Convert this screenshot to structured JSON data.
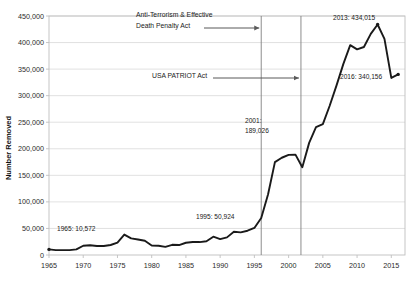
{
  "chart_data": {
    "type": "line",
    "title": "",
    "xlabel": "",
    "ylabel": "Number Removed",
    "xlim": [
      1965,
      2017
    ],
    "ylim": [
      0,
      450000
    ],
    "grid": true,
    "legend": "none",
    "x_ticks": [
      "1965",
      "1970",
      "1975",
      "1980",
      "1985",
      "1990",
      "1995",
      "2000",
      "2005",
      "2010",
      "2015"
    ],
    "y_ticks": [
      "0",
      "50,000",
      "100,000",
      "150,000",
      "200,000",
      "250,000",
      "300,000",
      "350,000",
      "400,000",
      "450,000"
    ],
    "series": [
      {
        "name": "Number Removed",
        "x": [
          1965,
          1966,
          1967,
          1968,
          1969,
          1970,
          1971,
          1972,
          1973,
          1974,
          1975,
          1976,
          1977,
          1978,
          1979,
          1980,
          1981,
          1982,
          1983,
          1984,
          1985,
          1986,
          1987,
          1988,
          1989,
          1990,
          1991,
          1992,
          1993,
          1994,
          1995,
          1996,
          1997,
          1998,
          1999,
          2000,
          2001,
          2002,
          2003,
          2004,
          2005,
          2006,
          2007,
          2008,
          2009,
          2010,
          2011,
          2012,
          2013,
          2014,
          2015,
          2016
        ],
        "values": [
          10572,
          9168,
          9260,
          9130,
          10505,
          17469,
          18294,
          16883,
          16842,
          18824,
          23438,
          38471,
          31263,
          29277,
          26825,
          18013,
          17379,
          15216,
          19211,
          18696,
          23105,
          24592,
          24336,
          25829,
          34427,
          30039,
          33189,
          43671,
          42542,
          45674,
          50924,
          69680,
          114432,
          174813,
          183114,
          188467,
          189026,
          165168,
          211098,
          240665,
          246431,
          280974,
          319382,
          359795,
          395165,
          387242,
          391597,
          416324,
          434015,
          407075,
          333341,
          340056
        ]
      }
    ],
    "annotations": [
      {
        "name": "law-1996",
        "label": "Anti-Terrorism & Effective\nDeath Penalty Act",
        "line1": "Anti-Terrorism & Effective",
        "line2": "Death Penalty Act",
        "vline_year": 1996
      },
      {
        "name": "law-2001",
        "label": "USA PATRIOT Act",
        "line1": "USA PATRIOT Act",
        "vline_year": 2001.8
      }
    ],
    "point_labels": [
      {
        "name": "label-1965",
        "line1": "1965: 10,572",
        "year": 1965,
        "value": 10572
      },
      {
        "name": "label-1995",
        "line1": "1995: 50,924",
        "year": 1995,
        "value": 50924
      },
      {
        "name": "label-2001",
        "line1": "2001:",
        "line2": "189,026",
        "year": 2001,
        "value": 189026
      },
      {
        "name": "label-2013",
        "line1": "2013: 434,015",
        "year": 2013,
        "value": 434015
      },
      {
        "name": "label-2016",
        "line1": "2016: 340,156",
        "year": 2016,
        "value": 340156
      }
    ],
    "colors": {
      "line": "#1a1a1a",
      "grid": "#d9d9d9",
      "frame": "#bfbfbf",
      "vline": "#808080",
      "arrow": "#595959",
      "background": "#ffffff"
    }
  }
}
